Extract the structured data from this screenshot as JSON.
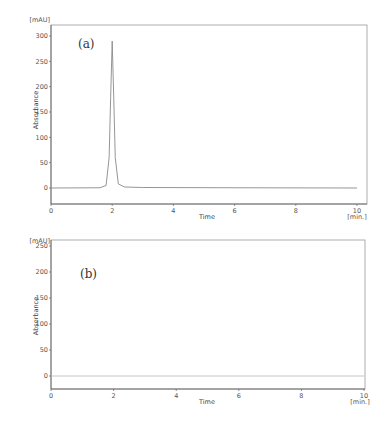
{
  "chart_data": [
    {
      "type": "line",
      "panel_label": "(a)",
      "title": "",
      "xlabel": "Time",
      "x_unit": "[min.]",
      "ylabel": "Absorbance",
      "y_unit": "[mAU]",
      "xlim": [
        0,
        10
      ],
      "ylim": [
        -30,
        320
      ],
      "x_ticks": [
        "0",
        "2",
        "4",
        "6",
        "8",
        "10"
      ],
      "y_ticks": [
        "0",
        "50",
        "100",
        "150",
        "200",
        "250",
        "300"
      ],
      "grid": false,
      "series": [
        {
          "name": "chromatogram (a)",
          "x": [
            0,
            1.6,
            1.8,
            1.9,
            1.95,
            2.0,
            2.05,
            2.1,
            2.2,
            2.4,
            3,
            6,
            10
          ],
          "y": [
            0,
            0.5,
            5,
            60,
            180,
            290,
            180,
            60,
            8,
            2,
            1,
            0.5,
            0
          ]
        }
      ],
      "annotations": [
        "(a)"
      ]
    },
    {
      "type": "line",
      "panel_label": "(b)",
      "title": "",
      "xlabel": "Time",
      "x_unit": "[min.]",
      "ylabel": "Absorbance",
      "y_unit": "[mAU]",
      "xlim": [
        0,
        10
      ],
      "ylim": [
        -25,
        260
      ],
      "x_ticks": [
        "0",
        "2",
        "4",
        "6",
        "8",
        "10"
      ],
      "y_ticks": [
        "0",
        "50",
        "100",
        "150",
        "200",
        "250"
      ],
      "grid": false,
      "series": [
        {
          "name": "chromatogram (b)",
          "x": [
            0,
            10
          ],
          "y": [
            0,
            0
          ]
        }
      ],
      "annotations": [
        "(b)"
      ]
    }
  ]
}
